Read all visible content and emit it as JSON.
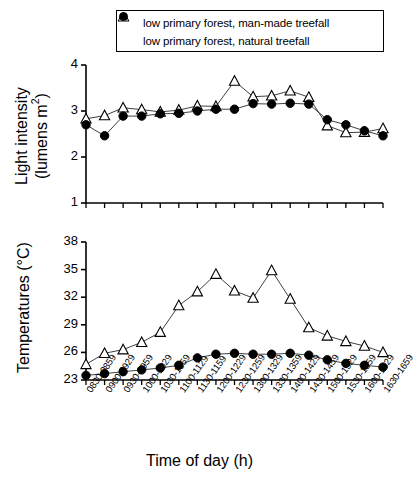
{
  "figure": {
    "xlabel": "Time of day (h)",
    "categories": [
      "0830-0859",
      "0900-0929",
      "0930-0959",
      "1000-1029",
      "1030-1059",
      "1100-1129",
      "1130-1159",
      "1200-1229",
      "1230-1259",
      "1300-1329",
      "1330-1359",
      "1400-1429",
      "1430-1459",
      "1500-1529",
      "1530-1559",
      "1600-1629",
      "1630-1659"
    ]
  },
  "legend": {
    "position": "top-center",
    "entries": [
      {
        "marker": "open-triangle",
        "label": "low primary forest, man-made treefall"
      },
      {
        "marker": "filled-circle",
        "label": "low primary forest, natural treefall"
      }
    ]
  },
  "chart_data": [
    {
      "id": "light-intensity",
      "type": "line",
      "title": "",
      "xlabel": "Time of day (h)",
      "ylabel": "Light intensity (lumens m²)",
      "ylabel_line1": "Light intensity",
      "ylabel_line2": "(lumens m",
      "ylabel_sup": "2",
      "ylabel_line2_end": ")",
      "ylim": [
        1,
        4
      ],
      "yticks": [
        1,
        2,
        3,
        4
      ],
      "ytick_labels": [
        "1",
        "2",
        "3",
        "4"
      ],
      "grid": false,
      "categories": [
        "0830-0859",
        "0900-0929",
        "0930-0959",
        "1000-1029",
        "1030-1059",
        "1100-1129",
        "1130-1159",
        "1200-1229",
        "1230-1259",
        "1300-1329",
        "1330-1359",
        "1400-1429",
        "1430-1459",
        "1500-1529",
        "1530-1559",
        "1600-1629",
        "1630-1659"
      ],
      "series": [
        {
          "name": "low primary forest, man-made treefall",
          "marker": "open-triangle",
          "color": "#000000",
          "values": [
            2.83,
            2.9,
            3.07,
            3.03,
            2.98,
            3.02,
            3.11,
            3.1,
            3.65,
            3.31,
            3.33,
            3.44,
            3.3,
            2.68,
            2.53,
            2.54,
            2.62,
            2.66
          ]
        },
        {
          "name": "low primary forest, natural treefall",
          "marker": "filled-circle",
          "color": "#000000",
          "values": [
            2.7,
            2.46,
            2.89,
            2.89,
            2.94,
            2.95,
            3.0,
            3.04,
            3.04,
            3.16,
            3.15,
            3.17,
            3.15,
            2.81,
            2.7,
            2.57,
            2.46,
            2.33
          ]
        }
      ]
    },
    {
      "id": "temperatures",
      "type": "line",
      "title": "",
      "xlabel": "Time of day (h)",
      "ylabel": "Temperatures (°C)",
      "ylim": [
        23,
        38
      ],
      "yticks": [
        23,
        26,
        29,
        32,
        35,
        38
      ],
      "ytick_labels": [
        "23",
        "26",
        "29",
        "32",
        "35",
        "38"
      ],
      "grid": false,
      "categories": [
        "0830-0859",
        "0900-0929",
        "0930-0959",
        "1000-1029",
        "1030-1059",
        "1100-1129",
        "1130-1159",
        "1200-1229",
        "1230-1259",
        "1300-1329",
        "1330-1359",
        "1400-1429",
        "1430-1459",
        "1500-1529",
        "1530-1559",
        "1600-1629",
        "1630-1659"
      ],
      "series": [
        {
          "name": "low primary forest, man-made treefall",
          "marker": "open-triangle",
          "color": "#000000",
          "values": [
            24.7,
            25.9,
            26.3,
            27.1,
            28.2,
            31.1,
            32.6,
            34.5,
            32.7,
            31.9,
            34.9,
            31.8,
            28.7,
            27.8,
            27.2,
            26.7,
            26.0
          ]
        },
        {
          "name": "low primary forest, natural treefall",
          "marker": "filled-circle",
          "color": "#000000",
          "values": [
            23.5,
            23.7,
            23.9,
            24.1,
            24.3,
            24.6,
            25.4,
            25.8,
            25.9,
            25.8,
            25.8,
            25.9,
            25.7,
            25.2,
            24.8,
            24.6,
            24.4
          ]
        }
      ]
    }
  ]
}
